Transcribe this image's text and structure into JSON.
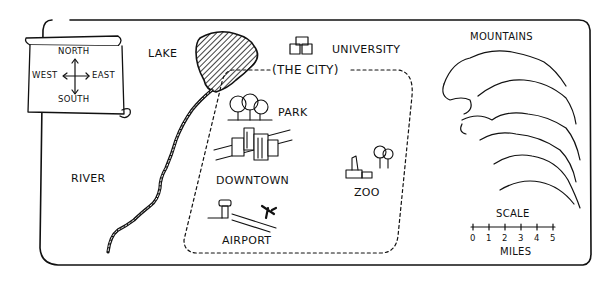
{
  "map": {
    "compass": {
      "north": "NORTH",
      "south": "SOUTH",
      "east": "EAST",
      "west": "WEST"
    },
    "labels": {
      "lake": "LAKE",
      "university": "UNIVERSITY",
      "the_city": "(THE CITY)",
      "park": "PARK",
      "downtown": "DOWNTOWN",
      "zoo": "ZOO",
      "airport": "AIRPORT",
      "river": "RIVER",
      "mountains": "MOUNTAINS"
    },
    "scale": {
      "title": "SCALE",
      "ticks": [
        "0",
        "1",
        "2",
        "3",
        "4",
        "5"
      ],
      "unit": "MILES"
    }
  }
}
